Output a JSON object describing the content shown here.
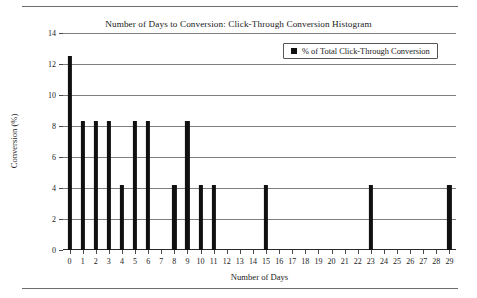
{
  "chart_data": {
    "type": "bar",
    "title": "Number of Days to Conversion: Click-Through Conversion Histogram",
    "xlabel": "Number of Days",
    "ylabel": "Conversion (%)",
    "legend": [
      {
        "name": "% of Total Click-Through Conversion",
        "color": "#101010",
        "marker": "square"
      }
    ],
    "legend_position": "top-right",
    "grid": true,
    "grid_axis": "y",
    "xlim": [
      -0.5,
      29.5
    ],
    "ylim": [
      0,
      14
    ],
    "yticks": [
      0,
      2,
      4,
      6,
      8,
      10,
      12,
      14
    ],
    "ytick_labels": [
      "0",
      "2",
      "4",
      "6",
      "8",
      "10",
      "12",
      "14"
    ],
    "categories": [
      0,
      1,
      2,
      3,
      4,
      5,
      6,
      7,
      8,
      9,
      10,
      11,
      12,
      13,
      14,
      15,
      16,
      17,
      18,
      19,
      20,
      21,
      22,
      23,
      24,
      25,
      26,
      27,
      28,
      29
    ],
    "xtick_labels": [
      "0",
      "1",
      "2",
      "3",
      "4",
      "5",
      "6",
      "7",
      "8",
      "9",
      "10",
      "11",
      "12",
      "13",
      "14",
      "15",
      "16",
      "17",
      "18",
      "19",
      "20",
      "21",
      "22",
      "23",
      "24",
      "25",
      "26",
      "27",
      "28",
      "29"
    ],
    "series": [
      {
        "name": "% of Total Click-Through Conversion",
        "color": "#101010",
        "values": [
          12.5,
          8.33,
          8.33,
          8.33,
          4.17,
          8.33,
          8.33,
          0,
          4.17,
          8.33,
          4.17,
          4.17,
          0,
          0,
          0,
          4.17,
          0,
          0,
          0,
          0,
          0,
          0,
          0,
          4.17,
          0,
          0,
          0,
          0,
          0,
          4.17
        ]
      }
    ]
  },
  "colors": {
    "bar": "#101010",
    "gridline": "#7e7e7e",
    "axis": "#2a2a2a",
    "rule": "#6d6d6d",
    "background": "#ffffff",
    "text": "#1a1a1a"
  }
}
